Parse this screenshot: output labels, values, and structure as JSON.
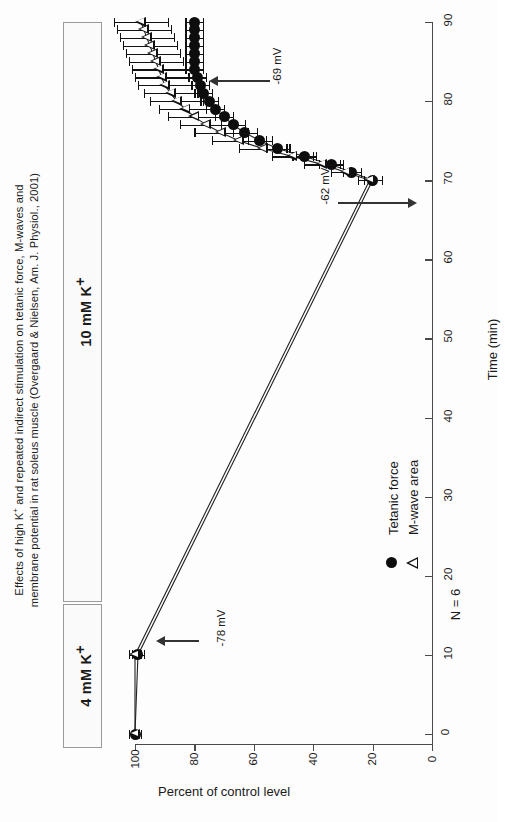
{
  "figure": {
    "title_line1": "Effects of high K+ and repeated indirect stimulation on tetanic force, M-waves and",
    "title_line2": "membrane potential in rat soleus muscle (Overgaard & Nielsen, Am. J. Physiol., 2001)",
    "title_l1_a": "Effects of high K",
    "title_l1_sup": "+",
    "title_l1_b": " and repeated indirect stimulation on tetanic force, M-waves and",
    "orientation": "rotated-90-ccw"
  },
  "conditions": [
    {
      "name": "condition-10mM",
      "label_a": "10 mM K",
      "label_sup": "+",
      "start_min": 10,
      "end_min": 90
    },
    {
      "name": "condition-4mM",
      "label_a": "4 mM K",
      "label_sup": "+",
      "start_min": 0,
      "end_min": 10
    }
  ],
  "legend": {
    "items": [
      {
        "marker": "filled-circle",
        "label": "Tetanic force"
      },
      {
        "marker": "open-triangle",
        "label": "M-wave area"
      }
    ],
    "n_text": "N = 6"
  },
  "annotations": [
    {
      "name": "annot-minus78",
      "text": "-78 mV",
      "arrow": "left",
      "at_time": 10
    },
    {
      "name": "annot-minus62",
      "text": "-62 mV",
      "arrow": "right",
      "at_time": 70
    },
    {
      "name": "annot-minus69",
      "text": "-69 mV",
      "arrow": "left",
      "at_time": 85
    }
  ],
  "chart_data": {
    "type": "scatter",
    "title": "Effects of high K+ and repeated indirect stimulation on tetanic force, M-waves and membrane potential in rat soleus muscle (Overgaard & Nielsen, Am. J. Physiol., 2001)",
    "xlabel": "Time (min)",
    "ylabel": "Percent of control level",
    "xlim": [
      0,
      90
    ],
    "ylim": [
      0,
      100
    ],
    "xticks": [
      0,
      10,
      20,
      30,
      40,
      50,
      60,
      70,
      80,
      90
    ],
    "yticks": [
      0,
      20,
      40,
      60,
      80,
      100
    ],
    "grid": false,
    "legend_position": "lower-middle",
    "n": 6,
    "series": [
      {
        "name": "Tetanic force",
        "marker": "filled-circle",
        "x": [
          0,
          10,
          70,
          71,
          72,
          73,
          74,
          75,
          76,
          77,
          78,
          79,
          80,
          81,
          82,
          83,
          84,
          85,
          86,
          87,
          88,
          89,
          90
        ],
        "y": [
          100,
          99,
          20,
          27,
          34,
          43,
          52,
          58,
          63,
          67,
          70,
          73,
          75,
          77,
          78,
          79,
          80,
          80,
          80,
          80,
          80,
          80,
          80
        ],
        "err": [
          2,
          2,
          3,
          3,
          4,
          4,
          4,
          4,
          4,
          4,
          3,
          3,
          3,
          3,
          3,
          3,
          3,
          3,
          3,
          3,
          3,
          3,
          3
        ]
      },
      {
        "name": "M-wave area",
        "marker": "open-triangle",
        "x": [
          0,
          10,
          70,
          71,
          72,
          73,
          74,
          75,
          76,
          77,
          78,
          79,
          80,
          81,
          82,
          83,
          84,
          85,
          86,
          87,
          88,
          89,
          90
        ],
        "y": [
          100,
          100,
          21,
          29,
          37,
          47,
          57,
          65,
          71,
          76,
          80,
          83,
          86,
          88,
          90,
          91,
          92,
          93,
          94,
          95,
          96,
          97,
          98
        ],
        "err": [
          2,
          2,
          4,
          5,
          6,
          7,
          8,
          9,
          9,
          9,
          9,
          9,
          9,
          9,
          9,
          9,
          9,
          9,
          9,
          9,
          9,
          9,
          9
        ]
      }
    ]
  }
}
